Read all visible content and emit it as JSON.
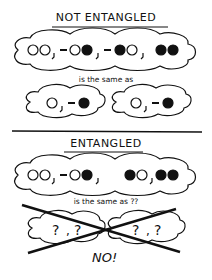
{
  "sections": [
    {
      "title": "NOT ENTANGLED",
      "caption": "is the same as",
      "combined_state": [
        "○○",
        ",",
        "-○●",
        ",",
        "-●○",
        ",",
        "●●"
      ],
      "factors": [
        "○",
        ",",
        "-●"
      ]
    },
    {
      "title": "ENTANGLED",
      "caption": "is the same as ??",
      "combined_state": [
        "○○",
        ",",
        "-○●",
        ",",
        "●○",
        ",",
        "●●"
      ],
      "factors": [
        "?",
        ",",
        "?"
      ],
      "verdict": "NO!"
    }
  ],
  "colors": {
    "ink": "#111111",
    "background": "#ffffff"
  }
}
